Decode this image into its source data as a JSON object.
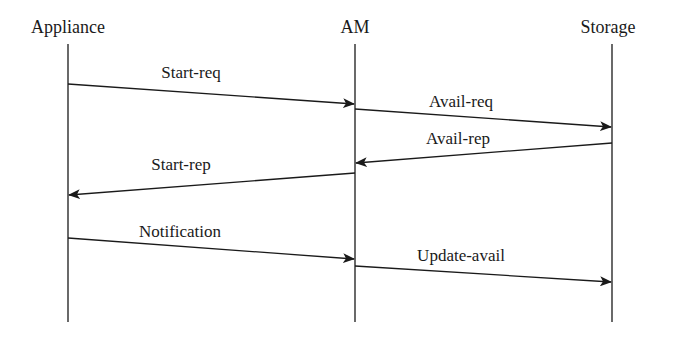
{
  "diagram": {
    "type": "sequence",
    "actors": [
      {
        "id": "appliance",
        "label": "Appliance",
        "x": 68
      },
      {
        "id": "am",
        "label": "AM",
        "x": 355
      },
      {
        "id": "storage",
        "label": "Storage",
        "x": 612
      }
    ],
    "messages": [
      {
        "label": "Start-req",
        "from": "appliance",
        "to": "am"
      },
      {
        "label": "Avail-req",
        "from": "am",
        "to": "storage"
      },
      {
        "label": "Avail-rep",
        "from": "storage",
        "to": "am"
      },
      {
        "label": "Start-rep",
        "from": "am",
        "to": "appliance"
      },
      {
        "label": "Notification",
        "from": "appliance",
        "to": "am"
      },
      {
        "label": "Update-avail",
        "from": "am",
        "to": "storage"
      }
    ],
    "colors": {
      "line": "#1a1a1a",
      "background": "#ffffff"
    }
  }
}
